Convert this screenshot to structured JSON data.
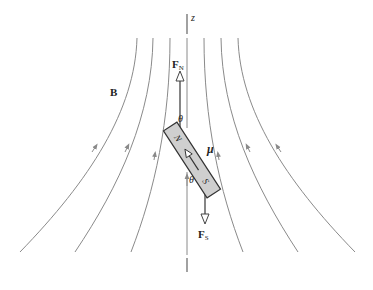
{
  "figure": {
    "axis_label": "z",
    "field_label": "B",
    "moment_label": "μ",
    "force_north_label": "F",
    "force_north_subscript": "N",
    "force_south_label": "F",
    "force_south_subscript": "S",
    "angle_label_top": "θ",
    "angle_label_bottom": "θ",
    "magnet_north_pole": "N",
    "magnet_south_pole": "S"
  },
  "colors": {
    "field_line": "#8a8a8a",
    "axis": "#555555",
    "magnet_fill": "#cfcfcf",
    "magnet_stroke": "#333333",
    "force_line": "#444444",
    "text": "#222222"
  }
}
